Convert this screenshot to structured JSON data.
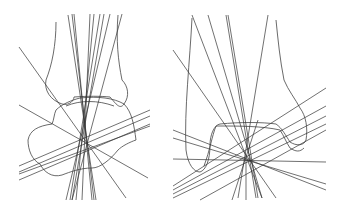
{
  "figure": {
    "panels": [
      {
        "id": "left",
        "label": "",
        "focal_point": [
          86,
          143
        ],
        "line_color": "#333333",
        "bone_color": "#444444"
      },
      {
        "id": "right",
        "label": "",
        "focal_point": [
          246,
          159
        ],
        "line_color": "#333333",
        "bone_color": "#444444"
      }
    ]
  }
}
